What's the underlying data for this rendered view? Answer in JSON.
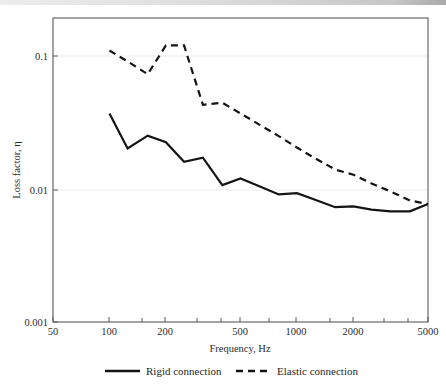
{
  "chart_data": {
    "type": "line",
    "title": "",
    "xlabel": "Frequency, Hz",
    "ylabel": "Loss factor, η",
    "xscale": "log",
    "yscale": "log",
    "xlim": [
      50,
      5000
    ],
    "ylim": [
      0.001,
      0.1
    ],
    "grid": false,
    "legend_position": "below",
    "xticks": [
      {
        "value": 50,
        "label": "50"
      },
      {
        "value": 100,
        "label": "100"
      },
      {
        "value": 200,
        "label": "200"
      },
      {
        "value": 500,
        "label": "500"
      },
      {
        "value": 1000,
        "label": "1000"
      },
      {
        "value": 2000,
        "label": "2000"
      },
      {
        "value": 5000,
        "label": "5000"
      }
    ],
    "yticks": [
      {
        "value": 0.1,
        "label": "0.1"
      },
      {
        "value": 0.01,
        "label": "0.01"
      },
      {
        "value": 0.001,
        "label": "0.001"
      }
    ],
    "series": [
      {
        "name": "Rigid connection",
        "style": "solid",
        "color": "#141414",
        "x": [
          100,
          125,
          160,
          200,
          250,
          315,
          400,
          500,
          630,
          800,
          1000,
          1250,
          1600,
          2000,
          2500,
          3150,
          4000,
          5000
        ],
        "y": [
          0.037,
          0.0202,
          0.0252,
          0.0225,
          0.016,
          0.0172,
          0.0107,
          0.012,
          0.0105,
          0.0091,
          0.0093,
          0.0083,
          0.0073,
          0.0074,
          0.007,
          0.0068,
          0.0068,
          0.0077
        ]
      },
      {
        "name": "Elastic connection",
        "style": "dashed",
        "color": "#141414",
        "x": [
          100,
          125,
          160,
          200,
          250,
          315,
          400,
          500,
          630,
          800,
          1000,
          1250,
          1600,
          2000,
          2500,
          3150,
          4000,
          5000
        ],
        "y": [
          0.11,
          0.091,
          0.073,
          0.12,
          0.12,
          0.043,
          0.0445,
          0.037,
          0.0305,
          0.025,
          0.0205,
          0.017,
          0.014,
          0.0128,
          0.011,
          0.0096,
          0.0082,
          0.0077
        ]
      }
    ],
    "legend": [
      {
        "label": "Rigid connection",
        "style": "solid"
      },
      {
        "label": "Elastic connection",
        "style": "dashed"
      }
    ]
  }
}
